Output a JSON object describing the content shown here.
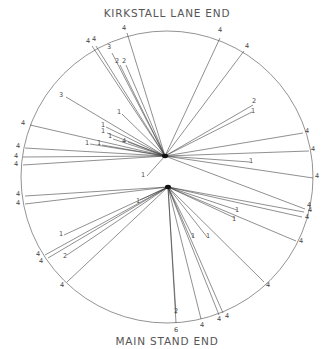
{
  "diagram": {
    "title_top": "KIRKSTALL LANE END",
    "title_bottom": "MAIN STAND END",
    "field": {
      "cx": 167,
      "cy": 177,
      "r": 146
    },
    "hubs": [
      {
        "name": "upper-wicket",
        "x": 165,
        "y": 156
      },
      {
        "name": "lower-wicket",
        "x": 168,
        "y": 187
      }
    ],
    "shots": [
      {
        "hub": 0,
        "x": 127,
        "y": 33,
        "runs": "4",
        "lx": 124,
        "ly": 30
      },
      {
        "hub": 0,
        "x": 92,
        "y": 46,
        "runs": "4",
        "lx": 88,
        "ly": 43
      },
      {
        "hub": 0,
        "x": 96,
        "y": 46,
        "runs": "4",
        "lx": 94,
        "ly": 41
      },
      {
        "hub": 0,
        "x": 112,
        "y": 53,
        "runs": "3",
        "lx": 109,
        "ly": 49
      },
      {
        "hub": 0,
        "x": 120,
        "y": 65,
        "runs": "2",
        "lx": 117,
        "ly": 63
      },
      {
        "hub": 0,
        "x": 126,
        "y": 65,
        "runs": "2",
        "lx": 124,
        "ly": 63
      },
      {
        "hub": 0,
        "x": 66,
        "y": 97,
        "runs": "3",
        "lx": 61,
        "ly": 97
      },
      {
        "hub": 0,
        "x": 122,
        "y": 114,
        "runs": "1",
        "lx": 119,
        "ly": 114
      },
      {
        "hub": 0,
        "x": 30,
        "y": 125,
        "runs": "4",
        "lx": 23,
        "ly": 125
      },
      {
        "hub": 0,
        "x": 106,
        "y": 127,
        "runs": "1",
        "lx": 103,
        "ly": 127
      },
      {
        "hub": 0,
        "x": 107,
        "y": 133,
        "runs": "1",
        "lx": 103,
        "ly": 133
      },
      {
        "hub": 0,
        "x": 113,
        "y": 139,
        "runs": "1",
        "lx": 110,
        "ly": 138
      },
      {
        "hub": 0,
        "x": 128,
        "y": 142,
        "runs": "4",
        "lx": 124,
        "ly": 143
      },
      {
        "hub": 0,
        "x": 25,
        "y": 148,
        "runs": "4",
        "lx": 18,
        "ly": 148
      },
      {
        "hub": 0,
        "x": 90,
        "y": 144,
        "runs": "1",
        "lx": 87,
        "ly": 145
      },
      {
        "hub": 0,
        "x": 102,
        "y": 145,
        "runs": "1",
        "lx": 99,
        "ly": 145
      },
      {
        "hub": 0,
        "x": 23,
        "y": 157,
        "runs": "4",
        "lx": 16,
        "ly": 158
      },
      {
        "hub": 0,
        "x": 23,
        "y": 165,
        "runs": "4",
        "lx": 16,
        "ly": 166
      },
      {
        "hub": 0,
        "x": 220,
        "y": 38,
        "runs": "4",
        "lx": 220,
        "ly": 32
      },
      {
        "hub": 0,
        "x": 244,
        "y": 51,
        "runs": "4",
        "lx": 247,
        "ly": 48
      },
      {
        "hub": 0,
        "x": 253,
        "y": 105,
        "runs": "2",
        "lx": 254,
        "ly": 103
      },
      {
        "hub": 0,
        "x": 252,
        "y": 112,
        "runs": "1",
        "lx": 253,
        "ly": 113
      },
      {
        "hub": 0,
        "x": 303,
        "y": 133,
        "runs": "4",
        "lx": 307,
        "ly": 133
      },
      {
        "hub": 0,
        "x": 309,
        "y": 151,
        "runs": "4",
        "lx": 313,
        "ly": 151
      },
      {
        "hub": 0,
        "x": 250,
        "y": 162,
        "runs": "1",
        "lx": 251,
        "ly": 163
      },
      {
        "hub": 0,
        "x": 313,
        "y": 178,
        "runs": "4",
        "lx": 317,
        "ly": 178
      },
      {
        "hub": 0,
        "x": 147,
        "y": 176,
        "runs": "1",
        "lx": 143,
        "ly": 177
      },
      {
        "hub": 0,
        "x": 305,
        "y": 209,
        "runs": "4",
        "lx": 309,
        "ly": 207
      },
      {
        "hub": 1,
        "x": 25,
        "y": 196,
        "runs": "4",
        "lx": 18,
        "ly": 196
      },
      {
        "hub": 1,
        "x": 25,
        "y": 204,
        "runs": "4",
        "lx": 18,
        "ly": 205
      },
      {
        "hub": 1,
        "x": 304,
        "y": 212,
        "runs": "4",
        "lx": 310,
        "ly": 212
      },
      {
        "hub": 1,
        "x": 302,
        "y": 217,
        "runs": "4",
        "lx": 307,
        "ly": 219
      },
      {
        "hub": 1,
        "x": 237,
        "y": 210,
        "runs": "1",
        "lx": 237,
        "ly": 212
      },
      {
        "hub": 1,
        "x": 235,
        "y": 218,
        "runs": "1",
        "lx": 234,
        "ly": 221
      },
      {
        "hub": 1,
        "x": 140,
        "y": 200,
        "runs": "1",
        "lx": 138,
        "ly": 203
      },
      {
        "hub": 1,
        "x": 64,
        "y": 235,
        "runs": "1",
        "lx": 61,
        "ly": 236
      },
      {
        "hub": 1,
        "x": 45,
        "y": 255,
        "runs": "4",
        "lx": 38,
        "ly": 256
      },
      {
        "hub": 1,
        "x": 48,
        "y": 258,
        "runs": "4",
        "lx": 41,
        "ly": 263
      },
      {
        "hub": 1,
        "x": 67,
        "y": 255,
        "runs": "2",
        "lx": 65,
        "ly": 258
      },
      {
        "hub": 1,
        "x": 67,
        "y": 282,
        "runs": "4",
        "lx": 62,
        "ly": 287
      },
      {
        "hub": 1,
        "x": 193,
        "y": 237,
        "runs": "1",
        "lx": 193,
        "ly": 238
      },
      {
        "hub": 1,
        "x": 207,
        "y": 237,
        "runs": "1",
        "lx": 208,
        "ly": 238
      },
      {
        "hub": 1,
        "x": 296,
        "y": 241,
        "runs": "4",
        "lx": 301,
        "ly": 243
      },
      {
        "hub": 1,
        "x": 264,
        "y": 282,
        "runs": "4",
        "lx": 268,
        "ly": 287
      },
      {
        "hub": 1,
        "x": 176,
        "y": 314,
        "runs": "2",
        "lx": 176,
        "ly": 313
      },
      {
        "hub": 1,
        "x": 176,
        "y": 323,
        "runs": "6",
        "lx": 176,
        "ly": 332
      },
      {
        "hub": 1,
        "x": 201,
        "y": 319,
        "runs": "4",
        "lx": 202,
        "ly": 327
      },
      {
        "hub": 1,
        "x": 219,
        "y": 315,
        "runs": "4",
        "lx": 219,
        "ly": 321
      },
      {
        "hub": 1,
        "x": 223,
        "y": 313,
        "runs": "4",
        "lx": 227,
        "ly": 318
      }
    ]
  }
}
